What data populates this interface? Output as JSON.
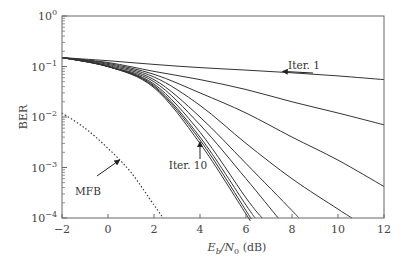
{
  "chart_data": {
    "type": "line",
    "title": "",
    "xlabel": "Eb/N0 (dB)",
    "xlabel_parts": {
      "E": "E",
      "b": "b",
      "slash": "/N",
      "zero": "0",
      "unit": " (dB)"
    },
    "ylabel": "BER",
    "xlim": [
      -2,
      12
    ],
    "ylim": [
      0.0001,
      1
    ],
    "yscale": "log",
    "grid": false,
    "x_ticks": [
      -2,
      0,
      2,
      4,
      6,
      8,
      10,
      12
    ],
    "x_tick_labels": [
      "−2",
      "0",
      "2",
      "4",
      "6",
      "8",
      "10",
      "12"
    ],
    "y_ticks": [
      1,
      0.1,
      0.01,
      0.001,
      0.0001
    ],
    "y_tick_labels": [
      {
        "base": "10",
        "exp": "0"
      },
      {
        "base": "10",
        "exp": "−1"
      },
      {
        "base": "10",
        "exp": "−2"
      },
      {
        "base": "10",
        "exp": "−3"
      },
      {
        "base": "10",
        "exp": "−4"
      }
    ],
    "series": [
      {
        "name": "Iter. 1",
        "style": "solid",
        "x": [
          -2,
          0,
          2,
          4,
          6,
          8,
          10,
          12
        ],
        "y": [
          0.15,
          0.13,
          0.11,
          0.095,
          0.085,
          0.075,
          0.065,
          0.055
        ]
      },
      {
        "name": "Iter. 2",
        "style": "solid",
        "x": [
          -2,
          0,
          2,
          4,
          6,
          8,
          10,
          12
        ],
        "y": [
          0.15,
          0.12,
          0.08,
          0.055,
          0.035,
          0.02,
          0.012,
          0.007
        ]
      },
      {
        "name": "Iter. 3",
        "style": "solid",
        "x": [
          -2,
          0,
          2,
          4,
          6,
          8,
          10,
          12
        ],
        "y": [
          0.15,
          0.115,
          0.07,
          0.03,
          0.012,
          0.004,
          0.0014,
          0.00042
        ]
      },
      {
        "name": "Iter. 4",
        "style": "solid",
        "x": [
          -2,
          0,
          2,
          4,
          6,
          8,
          10,
          10.6
        ],
        "y": [
          0.15,
          0.11,
          0.062,
          0.017,
          0.003,
          0.0006,
          0.00015,
          0.0001
        ]
      },
      {
        "name": "Iter. 5",
        "style": "solid",
        "x": [
          -2,
          0,
          2,
          4,
          6,
          8,
          8.3
        ],
        "y": [
          0.15,
          0.105,
          0.055,
          0.01,
          0.0012,
          0.00014,
          0.0001
        ]
      },
      {
        "name": "Iter. 6",
        "style": "solid",
        "x": [
          -2,
          0,
          2,
          4,
          6,
          7.4
        ],
        "y": [
          0.15,
          0.1,
          0.05,
          0.007,
          0.0006,
          0.0001
        ]
      },
      {
        "name": "Iter. 7",
        "style": "solid",
        "x": [
          -2,
          0,
          2,
          4,
          6,
          6.7
        ],
        "y": [
          0.15,
          0.1,
          0.045,
          0.005,
          0.00025,
          0.0001
        ]
      },
      {
        "name": "Iter. 8",
        "style": "solid",
        "x": [
          -2,
          0,
          2,
          4,
          6,
          6.4
        ],
        "y": [
          0.15,
          0.1,
          0.042,
          0.004,
          0.00018,
          0.0001
        ]
      },
      {
        "name": "Iter. 9",
        "style": "solid",
        "x": [
          -2,
          0,
          2,
          4,
          6,
          6.2
        ],
        "y": [
          0.15,
          0.1,
          0.04,
          0.0035,
          0.00014,
          0.0001
        ]
      },
      {
        "name": "Iter. 10",
        "style": "solid",
        "x": [
          -2,
          0,
          2,
          4,
          6,
          6.1
        ],
        "y": [
          0.15,
          0.1,
          0.038,
          0.003,
          0.00012,
          0.0001
        ]
      },
      {
        "name": "MFB",
        "style": "dotted",
        "x": [
          -2,
          -1,
          0,
          1,
          2,
          2.4
        ],
        "y": [
          0.012,
          0.006,
          0.0024,
          0.0008,
          0.00018,
          0.0001
        ]
      }
    ],
    "annotations": [
      {
        "text": "Iter. 1",
        "points_to": {
          "x": 7.6,
          "y": 0.08
        }
      },
      {
        "text": "Iter. 10",
        "points_to": {
          "x": 4.0,
          "y": 0.0032
        }
      },
      {
        "text": "MFB",
        "points_to": {
          "x": 0.5,
          "y": 0.0014
        }
      }
    ]
  }
}
